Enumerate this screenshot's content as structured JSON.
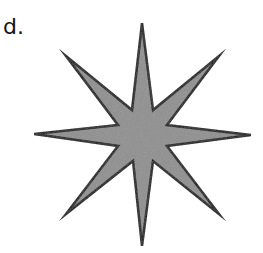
{
  "figure": {
    "label": "d.",
    "shape": "eight-pointed-star",
    "fill_color": "#8f8f8f",
    "stroke_color": "#111111",
    "stroke_width": 2.5,
    "points": "142,23 153,110 219,56 167,125 251,135 167,146 219,214 153,161 142,246 133,161 66,214 118,146 34,134 118,125 66,56 132,110"
  }
}
